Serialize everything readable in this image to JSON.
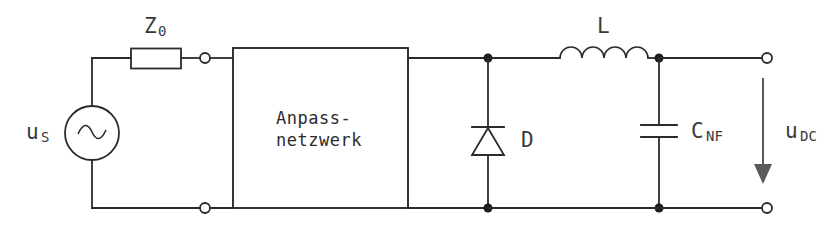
{
  "diagram": {
    "background_color": "#ffffff",
    "line_color": "#2b2b2b",
    "arrow_color": "#5a5a5a",
    "labels": {
      "source": {
        "base": "u",
        "sub": "S"
      },
      "impedance": {
        "base": "Z",
        "sub": "0"
      },
      "network_line1": "Anpass-",
      "network_line2": "netzwerk",
      "diode": "D",
      "inductor": "L",
      "capacitor": {
        "base": "C",
        "sub": "NF"
      },
      "output_voltage": {
        "base": "u",
        "sub": "DC"
      }
    },
    "components": [
      {
        "name": "ac-voltage-source",
        "type": "source",
        "label": "u_S"
      },
      {
        "name": "series-impedance-resistor",
        "type": "resistor",
        "label": "Z_0"
      },
      {
        "name": "matching-network-box",
        "type": "block",
        "label": "Anpass-netzwerk"
      },
      {
        "name": "rectifier-diode",
        "type": "diode",
        "label": "D"
      },
      {
        "name": "filter-inductor",
        "type": "inductor",
        "label": "L"
      },
      {
        "name": "smoothing-capacitor",
        "type": "capacitor",
        "label": "C_NF"
      },
      {
        "name": "output-voltage-arrow",
        "type": "arrow",
        "label": "u_DC"
      }
    ],
    "terminals": [
      {
        "name": "network-input-top-terminal"
      },
      {
        "name": "network-input-bottom-terminal"
      },
      {
        "name": "output-top-terminal"
      },
      {
        "name": "output-bottom-terminal"
      }
    ]
  }
}
